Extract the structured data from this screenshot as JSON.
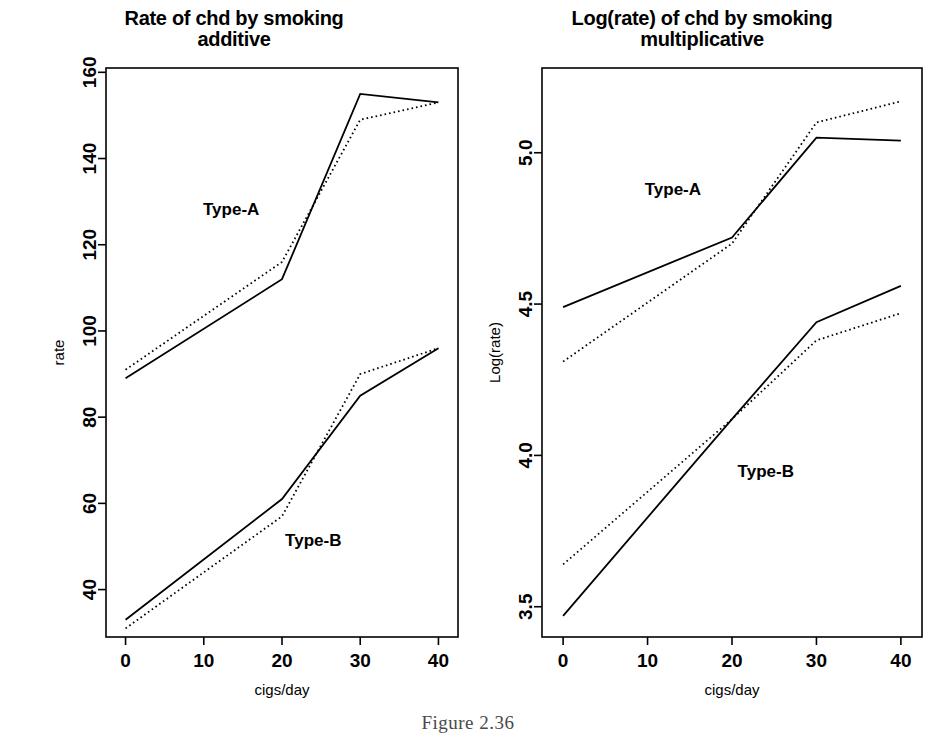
{
  "figure": {
    "caption": "Figure 2.36"
  },
  "panels": [
    {
      "id": "additive",
      "title": "Rate of chd by smoking\nadditive",
      "series_label_a": "Type-A",
      "series_label_b": "Type-B"
    },
    {
      "id": "multiplicative",
      "title": "Log(rate) of chd by smoking\nmultiplicative",
      "series_label_a": "Type-A",
      "series_label_b": "Type-B"
    }
  ],
  "chart_data": [
    {
      "type": "line",
      "id": "additive",
      "title": "Rate of chd by smoking additive",
      "xlabel": "cigs/day",
      "ylabel": "rate",
      "x": [
        0,
        20,
        30,
        40
      ],
      "xlim": [
        -2.5,
        42.5
      ],
      "ylim": [
        29,
        161
      ],
      "xticks": [
        0,
        10,
        20,
        30,
        40
      ],
      "xticklabels": [
        "0",
        "10",
        "20",
        "30",
        "40"
      ],
      "yticks": [
        40,
        60,
        80,
        100,
        120,
        140,
        160
      ],
      "yticklabels": [
        "40",
        "60",
        "80",
        "100",
        "120",
        "140",
        "160"
      ],
      "grid": false,
      "legend": "none",
      "annotations": [
        {
          "text": "Type-A",
          "x": 13.5,
          "y": 127
        },
        {
          "text": "Type-B",
          "x": 24.0,
          "y": 50
        }
      ],
      "series": [
        {
          "name": "Type-A observed",
          "style": "solid",
          "values": [
            89,
            112,
            155,
            153
          ]
        },
        {
          "name": "Type-A fitted",
          "style": "dotted",
          "values": [
            91,
            116,
            149,
            153
          ]
        },
        {
          "name": "Type-B observed",
          "style": "solid",
          "values": [
            33,
            61,
            85,
            96
          ]
        },
        {
          "name": "Type-B fitted",
          "style": "dotted",
          "values": [
            31,
            57,
            90,
            96
          ]
        }
      ]
    },
    {
      "type": "line",
      "id": "multiplicative",
      "title": "Log(rate) of chd by smoking multiplicative",
      "xlabel": "cigs/day",
      "ylabel": "Log(rate)",
      "x": [
        0,
        20,
        30,
        40
      ],
      "xlim": [
        -2.5,
        42.5
      ],
      "ylim": [
        3.4,
        5.28
      ],
      "xticks": [
        0,
        10,
        20,
        30,
        40
      ],
      "xticklabels": [
        "0",
        "10",
        "20",
        "30",
        "40"
      ],
      "yticks": [
        3.5,
        4.0,
        4.5,
        5.0
      ],
      "yticklabels": [
        "3.5",
        "4.0",
        "4.5",
        "5.0"
      ],
      "grid": false,
      "legend": "none",
      "annotations": [
        {
          "text": "Type-A",
          "x": 13.0,
          "y": 4.86
        },
        {
          "text": "Type-B",
          "x": 24.0,
          "y": 3.93
        }
      ],
      "series": [
        {
          "name": "Type-A observed",
          "style": "solid",
          "values": [
            4.49,
            4.72,
            5.05,
            5.04
          ]
        },
        {
          "name": "Type-A fitted",
          "style": "dotted",
          "values": [
            4.31,
            4.7,
            5.1,
            5.17
          ]
        },
        {
          "name": "Type-B observed",
          "style": "solid",
          "values": [
            3.47,
            4.12,
            4.44,
            4.56
          ]
        },
        {
          "name": "Type-B fitted",
          "style": "dotted",
          "values": [
            3.64,
            4.12,
            4.38,
            4.47
          ]
        }
      ]
    }
  ]
}
